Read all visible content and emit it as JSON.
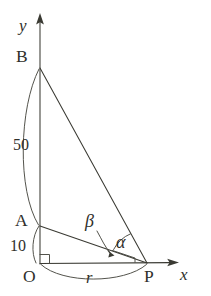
{
  "figure": {
    "background_color": "#ffffff",
    "ink_color": "#3a3a33"
  },
  "axes": {
    "x_label": "x",
    "y_label": "y",
    "origin_label": "O"
  },
  "points": {
    "B": "B",
    "A": "A",
    "O": "O",
    "P": "P"
  },
  "measurements": {
    "AB_length": "50",
    "OA_length": "10",
    "OP_length": "r"
  },
  "angles": {
    "alpha": "α",
    "beta": "β"
  },
  "geometry": {
    "B": [
      40,
      68
    ],
    "A": [
      40,
      226
    ],
    "O": [
      40,
      264
    ],
    "P": [
      147,
      263
    ]
  }
}
